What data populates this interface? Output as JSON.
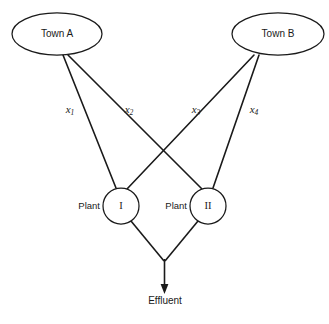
{
  "diagram": {
    "type": "flow-network",
    "sources": [
      {
        "id": "town-a",
        "label": "Town A",
        "cx": 57,
        "cy": 34,
        "rx": 45,
        "ry": 21
      },
      {
        "id": "town-b",
        "label": "Town B",
        "cx": 278,
        "cy": 34,
        "rx": 46,
        "ry": 21
      }
    ],
    "plants": [
      {
        "id": "plant-1",
        "prefix": "Plant",
        "numeral": "I",
        "cx": 121,
        "cy": 206,
        "r": 18
      },
      {
        "id": "plant-2",
        "prefix": "Plant",
        "numeral": "II",
        "cx": 208,
        "cy": 206,
        "r": 18
      }
    ],
    "sink": {
      "id": "effluent",
      "label": "Effluent",
      "x": 165,
      "y": 296
    },
    "flows": [
      {
        "id": "x1",
        "var": "x",
        "sub": "1",
        "from": "town-a",
        "to": "plant-1",
        "lx": 70,
        "ly": 110
      },
      {
        "id": "x2",
        "var": "x",
        "sub": "2",
        "from": "town-a",
        "to": "plant-2",
        "lx": 129,
        "ly": 110
      },
      {
        "id": "x3",
        "var": "x",
        "sub": "3",
        "from": "town-b",
        "to": "plant-1",
        "lx": 196,
        "ly": 110
      },
      {
        "id": "x4",
        "var": "x",
        "sub": "4",
        "from": "town-b",
        "to": "plant-2",
        "lx": 254,
        "ly": 110
      }
    ],
    "colors": {
      "stroke": "#1a1a1a",
      "fill": "#ffffff",
      "background": "#ffffff"
    }
  }
}
